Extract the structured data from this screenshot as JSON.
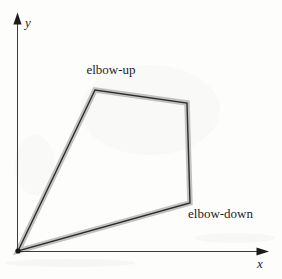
{
  "figure": {
    "type": "diagram",
    "axes": {
      "x_label": "x",
      "y_label": "y"
    },
    "annotations": {
      "elbow_up": "elbow-up",
      "elbow_down": "elbow-down"
    },
    "workspace_polygon": {
      "points": "18,251 95,90 187,103 190,203",
      "vertices": [
        [
          18,
          251
        ],
        [
          95,
          90
        ],
        [
          187,
          103
        ],
        [
          190,
          203
        ]
      ]
    },
    "colors": {
      "boundary_band": "#c2c2c2",
      "boundary_line": "#2d2d2d",
      "axis": "#3b3b3b",
      "text": "#1c1c1c",
      "background": "#fdfdfc"
    }
  }
}
